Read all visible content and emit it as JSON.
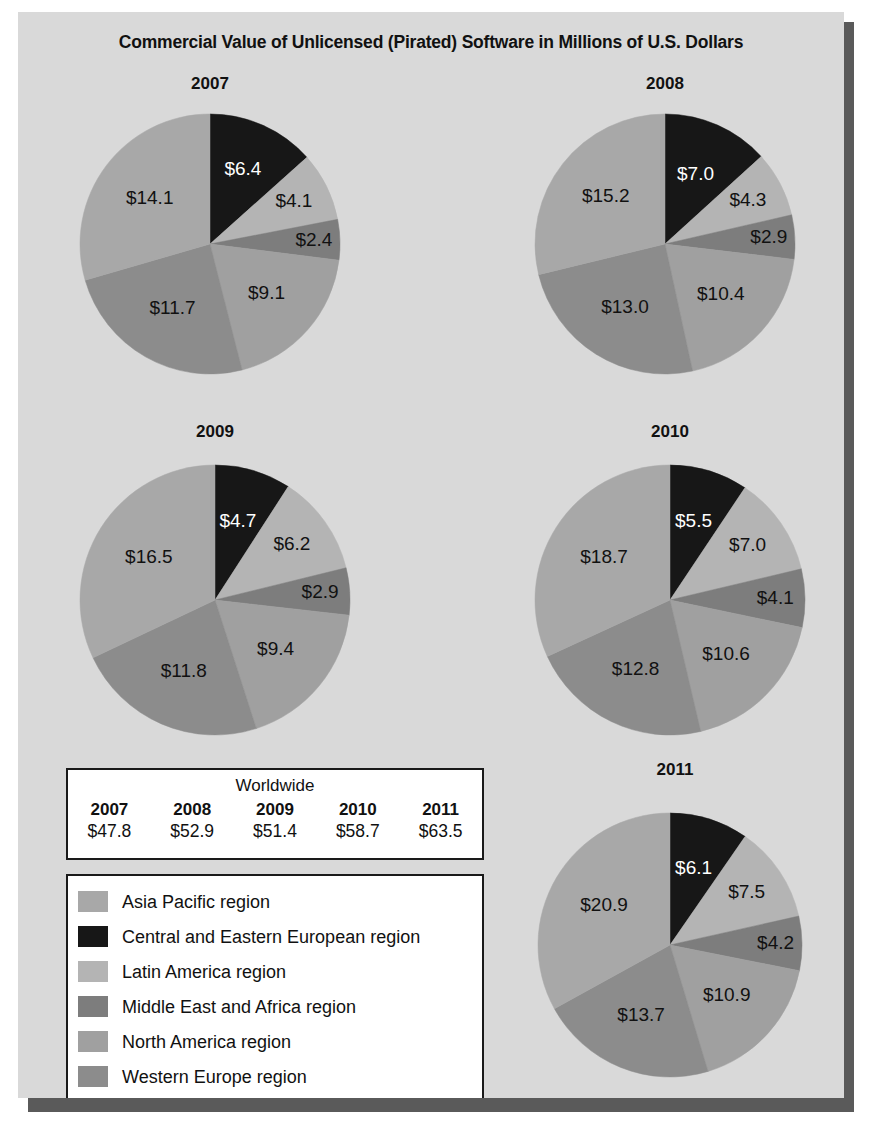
{
  "title": "Commercial Value of Unlicensed (Pirated) Software in Millions of U.S. Dollars",
  "colors": {
    "asia_pacific": "#a8a8a8",
    "central_eastern_europe": "#171717",
    "latin_america": "#b4b4b4",
    "middle_east_africa": "#7d7d7d",
    "north_america": "#a0a0a0",
    "western_europe": "#8c8c8c",
    "panel_background": "#d9d9d9",
    "shadow": "#5a5a5a",
    "outline": "#1a1a1a",
    "text": "#111111",
    "label_light": "#ffffff"
  },
  "legend": {
    "name": "region-legend",
    "items": [
      {
        "key": "asia_pacific",
        "label": "Asia Pacific region",
        "color": "#a8a8a8"
      },
      {
        "key": "central_eastern_europe",
        "label": "Central and Eastern European region",
        "color": "#171717"
      },
      {
        "key": "latin_america",
        "label": "Latin America region",
        "color": "#b4b4b4"
      },
      {
        "key": "middle_east_africa",
        "label": "Middle East and Africa region",
        "color": "#7d7d7d"
      },
      {
        "key": "north_america",
        "label": "North America region",
        "color": "#a0a0a0"
      },
      {
        "key": "western_europe",
        "label": "Western Europe region",
        "color": "#8c8c8c"
      }
    ]
  },
  "worldwide_table": {
    "caption": "Worldwide",
    "headers": [
      "2007",
      "2008",
      "2009",
      "2010",
      "2011"
    ],
    "values": [
      "$47.8",
      "$52.9",
      "$51.4",
      "$58.7",
      "$63.5"
    ]
  },
  "chart_data": {
    "type": "pie",
    "title": "Commercial Value of Unlicensed (Pirated) Software in Millions of U.S. Dollars",
    "unit": "billions of U.S. dollars (labels shown as $X.X)",
    "legend_position": "bottom-left",
    "series_order": [
      "Central and Eastern European region",
      "Latin America region",
      "Middle East and Africa region",
      "North America region",
      "Western Europe region",
      "Asia Pacific region"
    ],
    "slice_colors": [
      "#171717",
      "#b4b4b4",
      "#7d7d7d",
      "#a0a0a0",
      "#8c8c8c",
      "#a8a8a8"
    ],
    "charts": [
      {
        "title": "2007",
        "total": 47.8,
        "total_label": "$47.8",
        "slices": [
          {
            "region": "Central and Eastern European region",
            "value": 6.4,
            "label": "$6.4",
            "color": "#171717",
            "label_color": "#ffffff"
          },
          {
            "region": "Latin America region",
            "value": 4.1,
            "label": "$4.1",
            "color": "#b4b4b4",
            "label_color": "#111111"
          },
          {
            "region": "Middle East and Africa region",
            "value": 2.4,
            "label": "$2.4",
            "color": "#7d7d7d",
            "label_color": "#111111"
          },
          {
            "region": "North America region",
            "value": 9.1,
            "label": "$9.1",
            "color": "#a0a0a0",
            "label_color": "#111111"
          },
          {
            "region": "Western Europe region",
            "value": 11.7,
            "label": "$11.7",
            "color": "#8c8c8c",
            "label_color": "#111111"
          },
          {
            "region": "Asia Pacific region",
            "value": 14.1,
            "label": "$14.1",
            "color": "#a8a8a8",
            "label_color": "#111111"
          }
        ]
      },
      {
        "title": "2008",
        "total": 52.9,
        "total_label": "$52.9",
        "slices": [
          {
            "region": "Central and Eastern European region",
            "value": 7.0,
            "label": "$7.0",
            "color": "#171717",
            "label_color": "#ffffff"
          },
          {
            "region": "Latin America region",
            "value": 4.3,
            "label": "$4.3",
            "color": "#b4b4b4",
            "label_color": "#111111"
          },
          {
            "region": "Middle East and Africa region",
            "value": 2.9,
            "label": "$2.9",
            "color": "#7d7d7d",
            "label_color": "#111111"
          },
          {
            "region": "North America region",
            "value": 10.4,
            "label": "$10.4",
            "color": "#a0a0a0",
            "label_color": "#111111"
          },
          {
            "region": "Western Europe region",
            "value": 13.0,
            "label": "$13.0",
            "color": "#8c8c8c",
            "label_color": "#111111"
          },
          {
            "region": "Asia Pacific region",
            "value": 15.2,
            "label": "$15.2",
            "color": "#a8a8a8",
            "label_color": "#111111"
          }
        ]
      },
      {
        "title": "2009",
        "total": 51.4,
        "total_label": "$51.4",
        "slices": [
          {
            "region": "Central and Eastern European region",
            "value": 4.7,
            "label": "$4.7",
            "color": "#171717",
            "label_color": "#ffffff"
          },
          {
            "region": "Latin America region",
            "value": 6.2,
            "label": "$6.2",
            "color": "#b4b4b4",
            "label_color": "#111111"
          },
          {
            "region": "Middle East and Africa region",
            "value": 2.9,
            "label": "$2.9",
            "color": "#7d7d7d",
            "label_color": "#111111"
          },
          {
            "region": "North America region",
            "value": 9.4,
            "label": "$9.4",
            "color": "#a0a0a0",
            "label_color": "#111111"
          },
          {
            "region": "Western Europe region",
            "value": 11.8,
            "label": "$11.8",
            "color": "#8c8c8c",
            "label_color": "#111111"
          },
          {
            "region": "Asia Pacific region",
            "value": 16.5,
            "label": "$16.5",
            "color": "#a8a8a8",
            "label_color": "#111111"
          }
        ]
      },
      {
        "title": "2010",
        "total": 58.7,
        "total_label": "$58.7",
        "slices": [
          {
            "region": "Central and Eastern European region",
            "value": 5.5,
            "label": "$5.5",
            "color": "#171717",
            "label_color": "#ffffff"
          },
          {
            "region": "Latin America region",
            "value": 7.0,
            "label": "$7.0",
            "color": "#b4b4b4",
            "label_color": "#111111"
          },
          {
            "region": "Middle East and Africa region",
            "value": 4.1,
            "label": "$4.1",
            "color": "#7d7d7d",
            "label_color": "#111111"
          },
          {
            "region": "North America region",
            "value": 10.6,
            "label": "$10.6",
            "color": "#a0a0a0",
            "label_color": "#111111"
          },
          {
            "region": "Western Europe region",
            "value": 12.8,
            "label": "$12.8",
            "color": "#8c8c8c",
            "label_color": "#111111"
          },
          {
            "region": "Asia Pacific region",
            "value": 18.7,
            "label": "$18.7",
            "color": "#a8a8a8",
            "label_color": "#111111"
          }
        ]
      },
      {
        "title": "2011",
        "total": 63.5,
        "total_label": "$63.5",
        "slices": [
          {
            "region": "Central and Eastern European region",
            "value": 6.1,
            "label": "$6.1",
            "color": "#171717",
            "label_color": "#ffffff"
          },
          {
            "region": "Latin America region",
            "value": 7.5,
            "label": "$7.5",
            "color": "#b4b4b4",
            "label_color": "#111111"
          },
          {
            "region": "Middle East and Africa region",
            "value": 4.2,
            "label": "$4.2",
            "color": "#7d7d7d",
            "label_color": "#111111"
          },
          {
            "region": "North America region",
            "value": 10.9,
            "label": "$10.9",
            "color": "#a0a0a0",
            "label_color": "#111111"
          },
          {
            "region": "Western Europe region",
            "value": 13.7,
            "label": "$13.7",
            "color": "#8c8c8c",
            "label_color": "#111111"
          },
          {
            "region": "Asia Pacific region",
            "value": 20.9,
            "label": "$20.9",
            "color": "#a8a8a8",
            "label_color": "#111111"
          }
        ]
      }
    ]
  },
  "layout": {
    "pies": [
      {
        "index": 0,
        "left": 42,
        "top": 62,
        "size": 300,
        "title_top": 0,
        "cx": 150,
        "cy": 170,
        "r": 130
      },
      {
        "index": 1,
        "left": 497,
        "top": 62,
        "size": 300,
        "title_top": 0,
        "cx": 150,
        "cy": 170,
        "r": 130
      },
      {
        "index": 2,
        "left": 42,
        "top": 410,
        "size": 310,
        "title_top": 0,
        "cx": 155,
        "cy": 178,
        "r": 135
      },
      {
        "index": 3,
        "left": 497,
        "top": 410,
        "size": 310,
        "title_top": 0,
        "cx": 155,
        "cy": 178,
        "r": 135
      },
      {
        "index": 4,
        "left": 497,
        "top": 748,
        "size": 320,
        "title_top": 0,
        "cx": 155,
        "cy": 185,
        "r": 132
      }
    ]
  }
}
